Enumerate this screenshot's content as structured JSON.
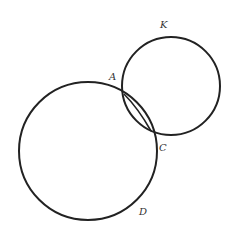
{
  "diagram": {
    "type": "geometry-circles",
    "stroke_color": "#222222",
    "labels": {
      "K": "K",
      "A": "A",
      "C": "C",
      "D": "D"
    },
    "circles": [
      {
        "name": "large-circle",
        "cx": 88,
        "cy": 151,
        "r": 69
      },
      {
        "name": "small-circle",
        "cx": 171,
        "cy": 86,
        "r": 49
      }
    ],
    "intersection_points": {
      "A": {
        "x": 124,
        "y": 94
      },
      "C": {
        "x": 151,
        "y": 131
      }
    }
  }
}
